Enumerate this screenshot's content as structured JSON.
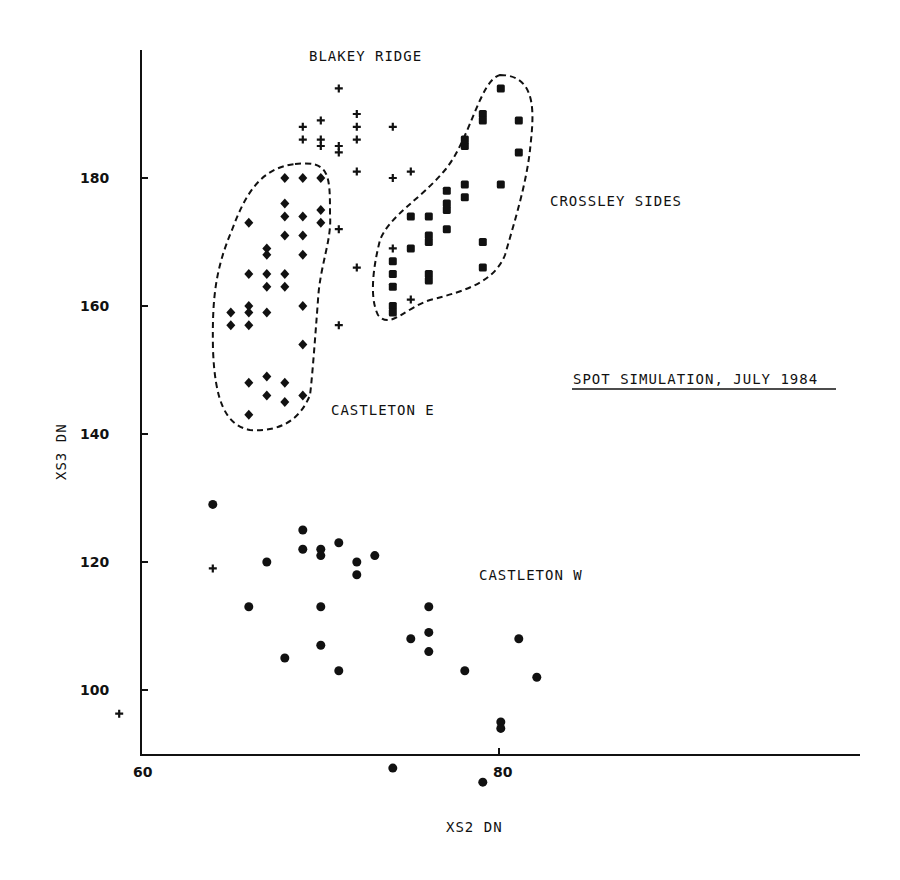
{
  "chart_data": {
    "type": "scatter",
    "title": "SPOT SIMULATION, JULY 1984",
    "xlabel": "XS2   DN",
    "ylabel": "XS3   DN",
    "xlim": [
      60,
      100
    ],
    "ylim": [
      90.2,
      194
    ],
    "x_ticks": [
      60,
      80
    ],
    "y_ticks": [
      100,
      120,
      140,
      160,
      180
    ],
    "grid": false,
    "legend": "none (clusters labelled directly)",
    "annotations": [
      "BLAKEY RIDGE",
      "CROSSLEY SIDES",
      "CASTLETON E",
      "CASTLETON W",
      "SPOT SIMULATION, JULY 1984"
    ],
    "series": [
      {
        "name": "BLAKEY RIDGE",
        "marker": "plus",
        "points": [
          [
            71.1,
            194
          ],
          [
            69.1,
            188
          ],
          [
            70.1,
            189
          ],
          [
            72.1,
            190
          ],
          [
            69.1,
            186
          ],
          [
            70.1,
            186
          ],
          [
            70.1,
            185
          ],
          [
            71.1,
            185
          ],
          [
            71.1,
            184
          ],
          [
            72.1,
            188
          ],
          [
            72.1,
            186
          ],
          [
            74.1,
            188
          ],
          [
            72.1,
            181
          ],
          [
            74.1,
            180
          ],
          [
            75.1,
            181
          ],
          [
            71.1,
            172
          ],
          [
            72.1,
            166
          ],
          [
            71.1,
            157
          ],
          [
            74.1,
            169
          ],
          [
            75.1,
            161
          ],
          [
            64.1,
            119
          ],
          [
            58.9,
            96.3
          ]
        ]
      },
      {
        "name": "CASTLETON E",
        "marker": "diamond",
        "points": [
          [
            68.1,
            180
          ],
          [
            69.1,
            180
          ],
          [
            70.1,
            180
          ],
          [
            68.1,
            176
          ],
          [
            68.1,
            174
          ],
          [
            69.1,
            174
          ],
          [
            70.1,
            175
          ],
          [
            70.1,
            173
          ],
          [
            66.1,
            173
          ],
          [
            68.1,
            171
          ],
          [
            69.1,
            171
          ],
          [
            67.1,
            169
          ],
          [
            67.1,
            168
          ],
          [
            69.1,
            168
          ],
          [
            66.1,
            165
          ],
          [
            67.1,
            165
          ],
          [
            68.1,
            165
          ],
          [
            67.1,
            163
          ],
          [
            68.1,
            163
          ],
          [
            65.1,
            159
          ],
          [
            66.1,
            160
          ],
          [
            66.1,
            159
          ],
          [
            67.1,
            159
          ],
          [
            69.1,
            160
          ],
          [
            65.1,
            157
          ],
          [
            66.1,
            157
          ],
          [
            69.1,
            154
          ],
          [
            66.1,
            148
          ],
          [
            67.1,
            149
          ],
          [
            68.1,
            148
          ],
          [
            67.1,
            146
          ],
          [
            68.1,
            145
          ],
          [
            69.1,
            146
          ],
          [
            66.1,
            143
          ]
        ]
      },
      {
        "name": "CROSSLEY SIDES",
        "marker": "square",
        "points": [
          [
            80.1,
            194
          ],
          [
            79.1,
            190
          ],
          [
            79.1,
            189
          ],
          [
            81.1,
            189
          ],
          [
            78.1,
            186
          ],
          [
            78.1,
            185
          ],
          [
            81.1,
            184
          ],
          [
            77.1,
            178
          ],
          [
            78.1,
            179
          ],
          [
            78.1,
            177
          ],
          [
            77.1,
            176
          ],
          [
            77.1,
            175
          ],
          [
            80.1,
            179
          ],
          [
            75.1,
            174
          ],
          [
            76.1,
            174
          ],
          [
            76.1,
            171
          ],
          [
            76.1,
            170
          ],
          [
            77.1,
            172
          ],
          [
            75.1,
            169
          ],
          [
            79.1,
            170
          ],
          [
            74.1,
            167
          ],
          [
            74.1,
            165
          ],
          [
            74.1,
            163
          ],
          [
            76.1,
            165
          ],
          [
            76.1,
            164
          ],
          [
            79.1,
            166
          ],
          [
            74.1,
            160
          ],
          [
            74.1,
            159
          ]
        ]
      },
      {
        "name": "CASTLETON W",
        "marker": "circle",
        "points": [
          [
            64.1,
            129
          ],
          [
            69.1,
            125
          ],
          [
            69.1,
            122
          ],
          [
            70.1,
            122
          ],
          [
            70.1,
            121
          ],
          [
            71.1,
            123
          ],
          [
            72.1,
            120
          ],
          [
            72.1,
            118
          ],
          [
            73.1,
            121
          ],
          [
            67.1,
            120
          ],
          [
            66.1,
            113
          ],
          [
            70.1,
            113
          ],
          [
            70.1,
            107
          ],
          [
            68.1,
            105
          ],
          [
            71.1,
            103
          ],
          [
            75.1,
            108
          ],
          [
            76.1,
            113
          ],
          [
            76.1,
            109
          ],
          [
            76.1,
            106
          ],
          [
            78.1,
            103
          ],
          [
            81.1,
            108
          ],
          [
            82.1,
            102
          ],
          [
            80.1,
            95
          ],
          [
            80.1,
            94
          ],
          [
            74.1,
            87.8
          ],
          [
            79.1,
            85.6
          ]
        ]
      }
    ]
  },
  "labels": {
    "blakey": "BLAKEY RIDGE",
    "crossley": "CROSSLEY SIDES",
    "castleton_e": "CASTLETON E",
    "castleton_w": "CASTLETON W",
    "title": "SPOT SIMULATION, JULY 1984",
    "xlabel": "XS2   DN",
    "ylabel": "XS3   DN"
  }
}
